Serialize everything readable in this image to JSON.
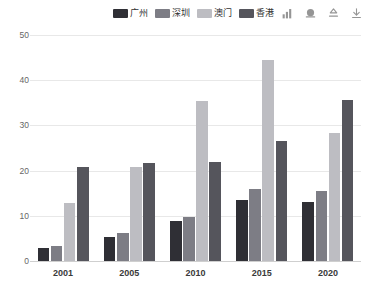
{
  "chart_data": {
    "type": "bar",
    "title": "",
    "subtitle": "",
    "xlabel": "",
    "ylabel": "",
    "categories": [
      "2001",
      "2005",
      "2010",
      "2015",
      "2020"
    ],
    "series": [
      {
        "name": "广州",
        "color": "#2f2f35",
        "values": [
          2.8,
          5.4,
          8.8,
          13.5,
          13.1
        ]
      },
      {
        "name": "深圳",
        "color": "#7d7d85",
        "values": [
          3.4,
          6.1,
          9.8,
          16.0,
          15.4
        ]
      },
      {
        "name": "澳门",
        "color": "#bdbdc2",
        "values": [
          12.8,
          20.8,
          35.4,
          44.4,
          28.3
        ]
      },
      {
        "name": "香港",
        "color": "#55555c",
        "values": [
          20.8,
          21.7,
          21.9,
          26.6,
          35.7
        ]
      }
    ],
    "ylim": [
      0,
      50
    ],
    "yticks": [
      0,
      10,
      20,
      30,
      40,
      50
    ],
    "grid": true,
    "legend_position": "top-center",
    "background": "#ffffff",
    "gridline_color": "#e8e8e8",
    "axis_color": "#cfcfcf",
    "tick_text_color": "#666666",
    "category_text_color": "#3a3a3a"
  },
  "legend": {
    "items": [
      {
        "label": "广州"
      },
      {
        "label": "深圳"
      },
      {
        "label": "澳门"
      },
      {
        "label": "香港"
      }
    ]
  },
  "toolbox": {
    "items": [
      {
        "name": "magic-type-bar-icon",
        "title": "切换为柱状图"
      },
      {
        "name": "data-view-icon",
        "title": "数据视图"
      },
      {
        "name": "restore-icon",
        "title": "还原"
      },
      {
        "name": "save-image-icon",
        "title": "保存为图片"
      }
    ]
  }
}
